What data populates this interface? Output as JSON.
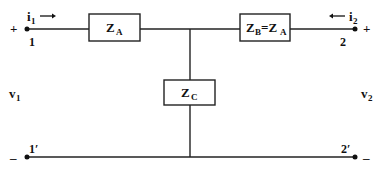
{
  "diagram": {
    "type": "two-port T-network",
    "impedances": {
      "series_left": {
        "label": "Z",
        "sub": "A"
      },
      "series_right": {
        "label": "Z",
        "sub": "B",
        "eq": "=Z",
        "eq_sub": "A"
      },
      "shunt": {
        "label": "Z",
        "sub": "C"
      }
    },
    "terminals": {
      "top_left": "1",
      "top_right": "2",
      "bottom_left": "1′",
      "bottom_right": "2′"
    },
    "currents": {
      "i1": {
        "label": "i",
        "sub": "1",
        "direction": "right"
      },
      "i2": {
        "label": "i",
        "sub": "2",
        "direction": "left"
      }
    },
    "voltages": {
      "v1": {
        "label": "v",
        "sub": "1"
      },
      "v2": {
        "label": "v",
        "sub": "2"
      }
    },
    "polarity": {
      "left_plus": "+",
      "left_minus": "–",
      "right_plus": "+",
      "right_minus": "–"
    }
  }
}
